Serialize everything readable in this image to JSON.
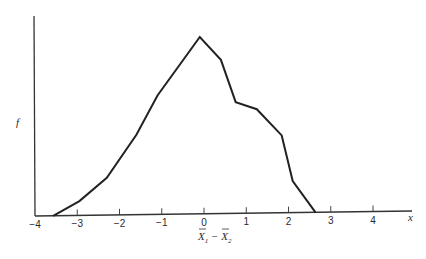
{
  "chart_data": {
    "type": "line",
    "title": "",
    "xlabel": "X̄1 − X̄2",
    "ylabel": "f",
    "x_axis_end_label": "x",
    "xlim": [
      -4,
      4.9
    ],
    "ylim": [
      0,
      1
    ],
    "grid": false,
    "legend": null,
    "x_ticks": [
      -4,
      -3,
      -2,
      -1,
      0,
      1,
      2,
      3,
      4
    ],
    "x_tick_labels": [
      "−4",
      "−3",
      "−2",
      "−1",
      "0",
      "1",
      "2",
      "3",
      "4"
    ],
    "series": [
      {
        "name": "frequency polygon",
        "x": [
          -3.57,
          -2.95,
          -2.3,
          -1.6,
          -1.1,
          -0.1,
          0.4,
          0.75,
          1.25,
          1.84,
          2.1,
          2.64
        ],
        "values": [
          0.0,
          0.08,
          0.21,
          0.45,
          0.67,
          1.0,
          0.87,
          0.63,
          0.59,
          0.44,
          0.18,
          0.0
        ]
      }
    ]
  }
}
